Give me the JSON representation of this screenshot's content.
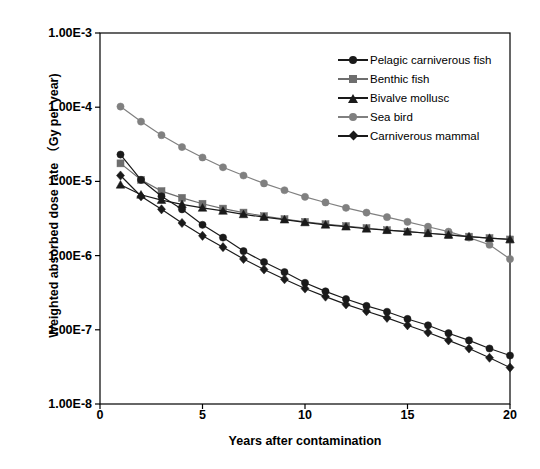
{
  "chart_data": {
    "type": "line",
    "title": "",
    "xlabel": "Years after contamination",
    "ylabel": "Weighted absorbed dose rate （Gy per year)",
    "xlim": [
      0,
      20
    ],
    "ylim": [
      1e-08,
      0.001
    ],
    "yscale": "log",
    "xscale": "linear",
    "grid": false,
    "legend_position": "top-right inside plot area",
    "xticks": [
      "0",
      "5",
      "10",
      "15",
      "20"
    ],
    "xtick_values": [
      0,
      5,
      10,
      15,
      20
    ],
    "yticks": [
      "1.00E-3",
      "1.00E-4",
      "1.00E-5",
      "1.00E-6",
      "1.00E-7",
      "1.00E-8"
    ],
    "ytick_values": [
      0.001,
      0.0001,
      1e-05,
      1e-06,
      1e-07,
      1e-08
    ],
    "x": [
      1,
      2,
      3,
      4,
      5,
      6,
      7,
      8,
      9,
      10,
      11,
      12,
      13,
      14,
      15,
      16,
      17,
      18,
      19,
      20
    ],
    "series": [
      {
        "name": "Pelagic carniverous fish",
        "marker": "circle",
        "color": "#1a1a1a",
        "line_color": "#1a1a1a",
        "values": [
          2.3e-05,
          1.05e-05,
          6.3e-06,
          4.2e-06,
          2.6e-06,
          1.75e-06,
          1.15e-06,
          8.2e-07,
          6e-07,
          4.3e-07,
          3.3e-07,
          2.6e-07,
          2.1e-07,
          1.75e-07,
          1.4e-07,
          1.15e-07,
          9e-08,
          7.2e-08,
          5.6e-08,
          4.5e-08
        ]
      },
      {
        "name": "Benthic fish",
        "marker": "square",
        "color": "#6e6e6e",
        "line_color": "#6e6e6e",
        "values": [
          1.75e-05,
          1.05e-05,
          7.4e-06,
          6e-06,
          5e-06,
          4.3e-06,
          3.8e-06,
          3.4e-06,
          3.1e-06,
          2.85e-06,
          2.65e-06,
          2.5e-06,
          2.35e-06,
          2.2e-06,
          2.1e-06,
          2e-06,
          1.9e-06,
          1.8e-06,
          1.72e-06,
          1.65e-06
        ]
      },
      {
        "name": "Bivalve mollusc",
        "marker": "triangle",
        "color": "#1a1a1a",
        "line_color": "#1a1a1a",
        "values": [
          9e-06,
          6.6e-06,
          5.6e-06,
          4.9e-06,
          4.4e-06,
          4e-06,
          3.6e-06,
          3.3e-06,
          3.05e-06,
          2.8e-06,
          2.6e-06,
          2.45e-06,
          2.3e-06,
          2.2e-06,
          2.1e-06,
          2e-06,
          1.9e-06,
          1.8e-06,
          1.72e-06,
          1.65e-06
        ]
      },
      {
        "name": "Sea bird",
        "marker": "circle",
        "color": "#808080",
        "line_color": "#808080",
        "values": [
          0.000102,
          6.4e-05,
          4.2e-05,
          2.9e-05,
          2.1e-05,
          1.55e-05,
          1.2e-05,
          9.4e-06,
          7.6e-06,
          6.2e-06,
          5.2e-06,
          4.4e-06,
          3.8e-06,
          3.3e-06,
          2.85e-06,
          2.45e-06,
          2.1e-06,
          1.75e-06,
          1.4e-06,
          9e-07
        ]
      },
      {
        "name": "Carniverous mammal",
        "marker": "diamond",
        "color": "#1a1a1a",
        "line_color": "#1a1a1a",
        "values": [
          1.2e-05,
          6.3e-06,
          4.2e-06,
          2.75e-06,
          1.85e-06,
          1.3e-06,
          9e-07,
          6.5e-07,
          4.8e-07,
          3.6e-07,
          2.8e-07,
          2.2e-07,
          1.78e-07,
          1.45e-07,
          1.15e-07,
          9.2e-08,
          7.2e-08,
          5.6e-08,
          4.2e-08,
          3.1e-08
        ]
      }
    ]
  },
  "plot": {
    "frame_color": "#000000",
    "background": "#ffffff"
  }
}
